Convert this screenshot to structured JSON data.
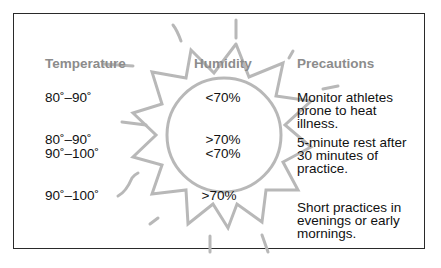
{
  "headers": {
    "temperature": "Temperature",
    "humidity": "Humidity",
    "precautions": "Precautions"
  },
  "rows": [
    {
      "temperature": "80˚–90˚",
      "humidity": "<70%",
      "precaution": "Monitor athletes prone to heat illness."
    },
    {
      "temperature": "80˚–90˚",
      "humidity": ">70%",
      "precaution": "5-minute rest after 30 minutes of practice."
    },
    {
      "temperature": "90˚–100˚",
      "humidity": "<70%",
      "precaution": ""
    },
    {
      "temperature": "90˚–100˚",
      "humidity": ">70%",
      "precaution": "Short practices in evenings or early mornings."
    }
  ],
  "illustration": {
    "icon": "sun-icon",
    "stroke_color": "#b8b8b8"
  },
  "colors": {
    "header_text": "#8c8c8c",
    "body_text": "#111111",
    "frame_border": "#2a2a2a",
    "background": "#ffffff"
  }
}
